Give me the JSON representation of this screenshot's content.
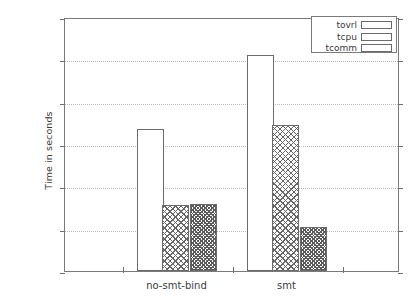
{
  "chart_data": {
    "type": "bar",
    "title": "",
    "xlabel": "",
    "ylabel": "Time in seconds",
    "categories": [
      "no-smt-bind",
      "smt"
    ],
    "series": [
      {
        "name": "tovrl",
        "values": [
          0.67,
          1.02
        ],
        "pattern": "empty"
      },
      {
        "name": "tcpu",
        "values": [
          0.31,
          0.69
        ],
        "pattern": "cross-sparse"
      },
      {
        "name": "tcomm",
        "values": [
          0.315,
          0.21
        ],
        "pattern": "cross-dense"
      }
    ],
    "ylim": [
      0,
      1.2
    ],
    "ytick_labels": [
      "0",
      "0.2",
      "0.4",
      "0.6",
      "0.8",
      "1",
      "1.2"
    ],
    "ytick_values": [
      0,
      0.2,
      0.4,
      0.6,
      0.8,
      1.0,
      1.2
    ],
    "grid": "horizontal-dotted",
    "legend_position": "top-right",
    "legend_entries": [
      "tovrl",
      "tcpu",
      "tcomm"
    ],
    "colors": {
      "background": "#ffffff",
      "axis": "#7a7a7a",
      "grid": "#b9b9b9",
      "text": "#3b3b3b",
      "bar_outline": "#6b6b6b"
    }
  }
}
